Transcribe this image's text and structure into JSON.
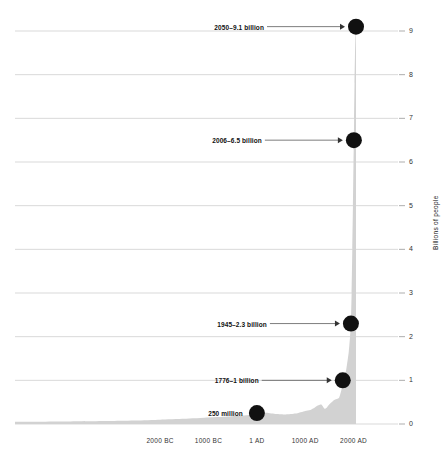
{
  "chart_data": {
    "type": "area",
    "title": "",
    "subtitle": "",
    "xlabel": "",
    "ylabel": "Billions of people",
    "ylim": [
      0,
      9.3
    ],
    "xlim": [
      -5000,
      2050
    ],
    "grid": true,
    "legend": "none",
    "fill_color": "#d2d2d2",
    "marker_color": "#111111",
    "gridline_color": "#c8c8c8",
    "y_ticks": [
      "0",
      "1",
      "2",
      "3",
      "4",
      "5",
      "6",
      "7",
      "8",
      "9"
    ],
    "y_tick_values": [
      0,
      1,
      2,
      3,
      4,
      5,
      6,
      7,
      8,
      9
    ],
    "x_ticks": [
      "2000 BC",
      "1000 BC",
      "1 AD",
      "1000 AD",
      "2000 AD"
    ],
    "x_tick_values": [
      -2000,
      -1000,
      1,
      1000,
      2000
    ],
    "series": [
      {
        "name": "World population",
        "x": [
          -5000,
          -4000,
          -3000,
          -2500,
          -2000,
          -1500,
          -1000,
          -800,
          -500,
          -200,
          1,
          200,
          400,
          600,
          800,
          1000,
          1100,
          1200,
          1250,
          1300,
          1340,
          1400,
          1450,
          1500,
          1600,
          1700,
          1750,
          1776,
          1800,
          1850,
          1900,
          1927,
          1945,
          1960,
          1974,
          1987,
          1999,
          2006,
          2011,
          2020,
          2030,
          2040,
          2050
        ],
        "values": [
          0.05,
          0.06,
          0.07,
          0.08,
          0.1,
          0.12,
          0.15,
          0.16,
          0.18,
          0.2,
          0.25,
          0.26,
          0.23,
          0.22,
          0.24,
          0.3,
          0.32,
          0.38,
          0.42,
          0.44,
          0.44,
          0.35,
          0.38,
          0.45,
          0.55,
          0.6,
          0.79,
          1.0,
          1.0,
          1.26,
          1.65,
          2.0,
          2.3,
          3.0,
          4.0,
          5.0,
          6.0,
          6.5,
          7.0,
          7.8,
          8.5,
          8.9,
          9.1
        ]
      }
    ],
    "annotations": [
      {
        "id": "anno-250-million",
        "label": "250 million",
        "year": 1,
        "value": 0.25,
        "has_arrow": false
      },
      {
        "id": "anno-1776",
        "label": "1776–1 billion",
        "year": 1776,
        "value": 1.0,
        "has_arrow": true
      },
      {
        "id": "anno-1945",
        "label": "1945–2.3 billion",
        "year": 1945,
        "value": 2.3,
        "has_arrow": true
      },
      {
        "id": "anno-2006",
        "label": "2006–6.5 billion",
        "year": 2006,
        "value": 6.5,
        "has_arrow": true
      },
      {
        "id": "anno-2050",
        "label": "2050–9.1 billion",
        "year": 2050,
        "value": 9.1,
        "has_arrow": true
      }
    ]
  }
}
